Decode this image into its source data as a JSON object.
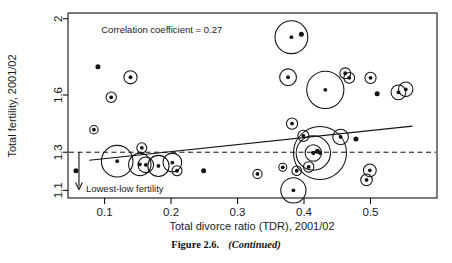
{
  "figure": {
    "caption_label": "Figure 2.6.",
    "caption_note": "(Continued)"
  },
  "chart_data": {
    "type": "scatter",
    "title": "",
    "xlabel": "Total divorce ratio (TDR), 2001/02",
    "ylabel": "Total fertility, 2001/02",
    "xlim": [
      0.045,
      0.6
    ],
    "ylim": [
      1.06,
      2.03
    ],
    "xticks": [
      0.1,
      0.2,
      0.3,
      0.4,
      0.5
    ],
    "xticklabels": [
      "0.1",
      "0.2",
      "0.3",
      "0.4",
      "0.5"
    ],
    "yticks": [
      1.1,
      1.3,
      1.6,
      2
    ],
    "yticklabels": [
      "1.1",
      "1.3",
      "1.6",
      "2"
    ],
    "grid": false,
    "legend": "none",
    "annotations": [
      {
        "name": "correlation-annotation",
        "text": "Correlation coefficient = 0.27",
        "x": 0.095,
        "y": 1.945
      },
      {
        "name": "lowest-low-annotation",
        "text": "Lowest-low fertility",
        "x": 0.072,
        "y": 1.112
      }
    ],
    "reference_line": {
      "name": "lowest-low-threshold",
      "type": "dashed-horizontal",
      "y": 1.3
    },
    "arrow": {
      "name": "lowest-low-arrow",
      "x": 0.0615,
      "y_from": 1.3,
      "y_to": 1.105,
      "direction": "down"
    },
    "trendline": {
      "name": "regression-line",
      "x": [
        0.077,
        0.563
      ],
      "y": [
        1.258,
        1.437
      ]
    },
    "marker_note": "bubbles sized by population; plain dots are unweighted points",
    "points": [
      {
        "x": 0.057,
        "y": 1.203,
        "r": 0,
        "bubble": false
      },
      {
        "x": 0.09,
        "y": 1.748,
        "r": 0,
        "bubble": false
      },
      {
        "x": 0.084,
        "y": 1.418,
        "r": 4.2,
        "bubble": true
      },
      {
        "x": 0.11,
        "y": 1.588,
        "r": 5.2,
        "bubble": true
      },
      {
        "x": 0.139,
        "y": 1.693,
        "r": 6.6,
        "bubble": true
      },
      {
        "x": 0.119,
        "y": 1.253,
        "r": 15.8,
        "bubble": true
      },
      {
        "x": 0.153,
        "y": 1.236,
        "r": 11.2,
        "bubble": true
      },
      {
        "x": 0.162,
        "y": 1.234,
        "r": 7.8,
        "bubble": true
      },
      {
        "x": 0.156,
        "y": 1.323,
        "r": 5.0,
        "bubble": true
      },
      {
        "x": 0.181,
        "y": 1.228,
        "r": 10.6,
        "bubble": true
      },
      {
        "x": 0.202,
        "y": 1.246,
        "r": 9.4,
        "bubble": true
      },
      {
        "x": 0.209,
        "y": 1.203,
        "r": 5.0,
        "bubble": true
      },
      {
        "x": 0.249,
        "y": 1.203,
        "r": 0,
        "bubble": false
      },
      {
        "x": 0.33,
        "y": 1.186,
        "r": 4.6,
        "bubble": true
      },
      {
        "x": 0.368,
        "y": 1.221,
        "r": 4.0,
        "bubble": true
      },
      {
        "x": 0.381,
        "y": 1.903,
        "r": 16.4,
        "bubble": true
      },
      {
        "x": 0.396,
        "y": 1.918,
        "r": 0,
        "bubble": false
      },
      {
        "x": 0.376,
        "y": 1.693,
        "r": 8.4,
        "bubble": true
      },
      {
        "x": 0.382,
        "y": 1.45,
        "r": 5.6,
        "bubble": true
      },
      {
        "x": 0.384,
        "y": 1.1,
        "r": 12.6,
        "bubble": true
      },
      {
        "x": 0.389,
        "y": 1.203,
        "r": 4.8,
        "bubble": true
      },
      {
        "x": 0.399,
        "y": 1.386,
        "r": 5.6,
        "bubble": true
      },
      {
        "x": 0.407,
        "y": 1.223,
        "r": 5.2,
        "bubble": true
      },
      {
        "x": 0.414,
        "y": 1.296,
        "r": 8.2,
        "bubble": true
      },
      {
        "x": 0.414,
        "y": 1.296,
        "r": 17.2,
        "bubble": true
      },
      {
        "x": 0.42,
        "y": 1.305,
        "r": 0,
        "bubble": false
      },
      {
        "x": 0.424,
        "y": 1.296,
        "r": 26.5,
        "bubble": true
      },
      {
        "x": 0.432,
        "y": 1.627,
        "r": 18.6,
        "bubble": true
      },
      {
        "x": 0.455,
        "y": 1.38,
        "r": 7.8,
        "bubble": true
      },
      {
        "x": 0.462,
        "y": 1.714,
        "r": 5.4,
        "bubble": true
      },
      {
        "x": 0.468,
        "y": 1.69,
        "r": 5.4,
        "bubble": true
      },
      {
        "x": 0.478,
        "y": 1.369,
        "r": 0,
        "bubble": false
      },
      {
        "x": 0.5,
        "y": 1.69,
        "r": 5.6,
        "bubble": true
      },
      {
        "x": 0.499,
        "y": 1.205,
        "r": 6.4,
        "bubble": true
      },
      {
        "x": 0.494,
        "y": 1.155,
        "r": 5.8,
        "bubble": true
      },
      {
        "x": 0.51,
        "y": 1.607,
        "r": 0,
        "bubble": false
      },
      {
        "x": 0.542,
        "y": 1.614,
        "r": 7.4,
        "bubble": true
      },
      {
        "x": 0.553,
        "y": 1.63,
        "r": 7.2,
        "bubble": true
      }
    ]
  }
}
